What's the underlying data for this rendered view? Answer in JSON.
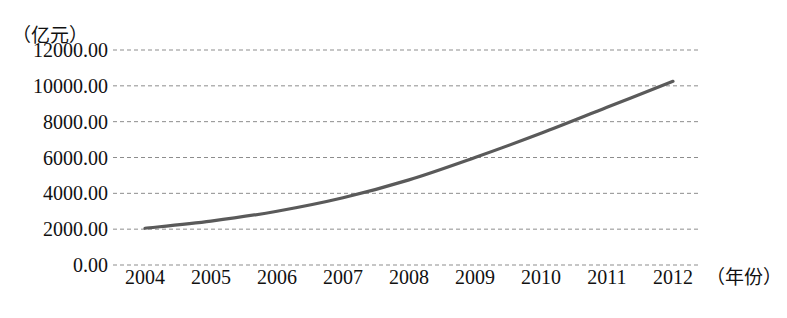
{
  "axes": {
    "y_unit_label": "（亿元）",
    "x_unit_label": "（年份）",
    "y_ticks": [
      "12000.00",
      "10000.00",
      "8000.00",
      "6000.00",
      "4000.00",
      "2000.00",
      "0.00"
    ],
    "x_ticks": [
      "2004",
      "2005",
      "2006",
      "2007",
      "2008",
      "2009",
      "2010",
      "2011",
      "2012"
    ]
  },
  "style": {
    "line_color": "#5a5a5a",
    "grid_color": "#8d8d8d",
    "text_color": "#111111",
    "background": "#ffffff"
  },
  "chart_data": {
    "type": "line",
    "title": "",
    "subtitle": "",
    "xlabel": "（年份）",
    "ylabel": "（亿元）",
    "x": [
      2004,
      2005,
      2006,
      2007,
      2008,
      2009,
      2010,
      2011,
      2012
    ],
    "categories": [
      "2004",
      "2005",
      "2006",
      "2007",
      "2008",
      "2009",
      "2010",
      "2011",
      "2012"
    ],
    "values": [
      2050,
      2450,
      3000,
      3750,
      4750,
      6000,
      7350,
      8800,
      10250
    ],
    "series": [
      {
        "name": "",
        "values": [
          2050,
          2450,
          3000,
          3750,
          4750,
          6000,
          7350,
          8800,
          10250
        ]
      }
    ],
    "ylim": [
      0,
      12000
    ],
    "ytick_values": [
      12000,
      10000,
      8000,
      6000,
      4000,
      2000,
      0
    ],
    "ytick_labels": [
      "12000.00",
      "10000.00",
      "8000.00",
      "6000.00",
      "4000.00",
      "2000.00",
      "0.00"
    ],
    "xlim": [
      2004,
      2012
    ],
    "grid": "horizontal-dashed",
    "legend": "none",
    "annotations": []
  }
}
